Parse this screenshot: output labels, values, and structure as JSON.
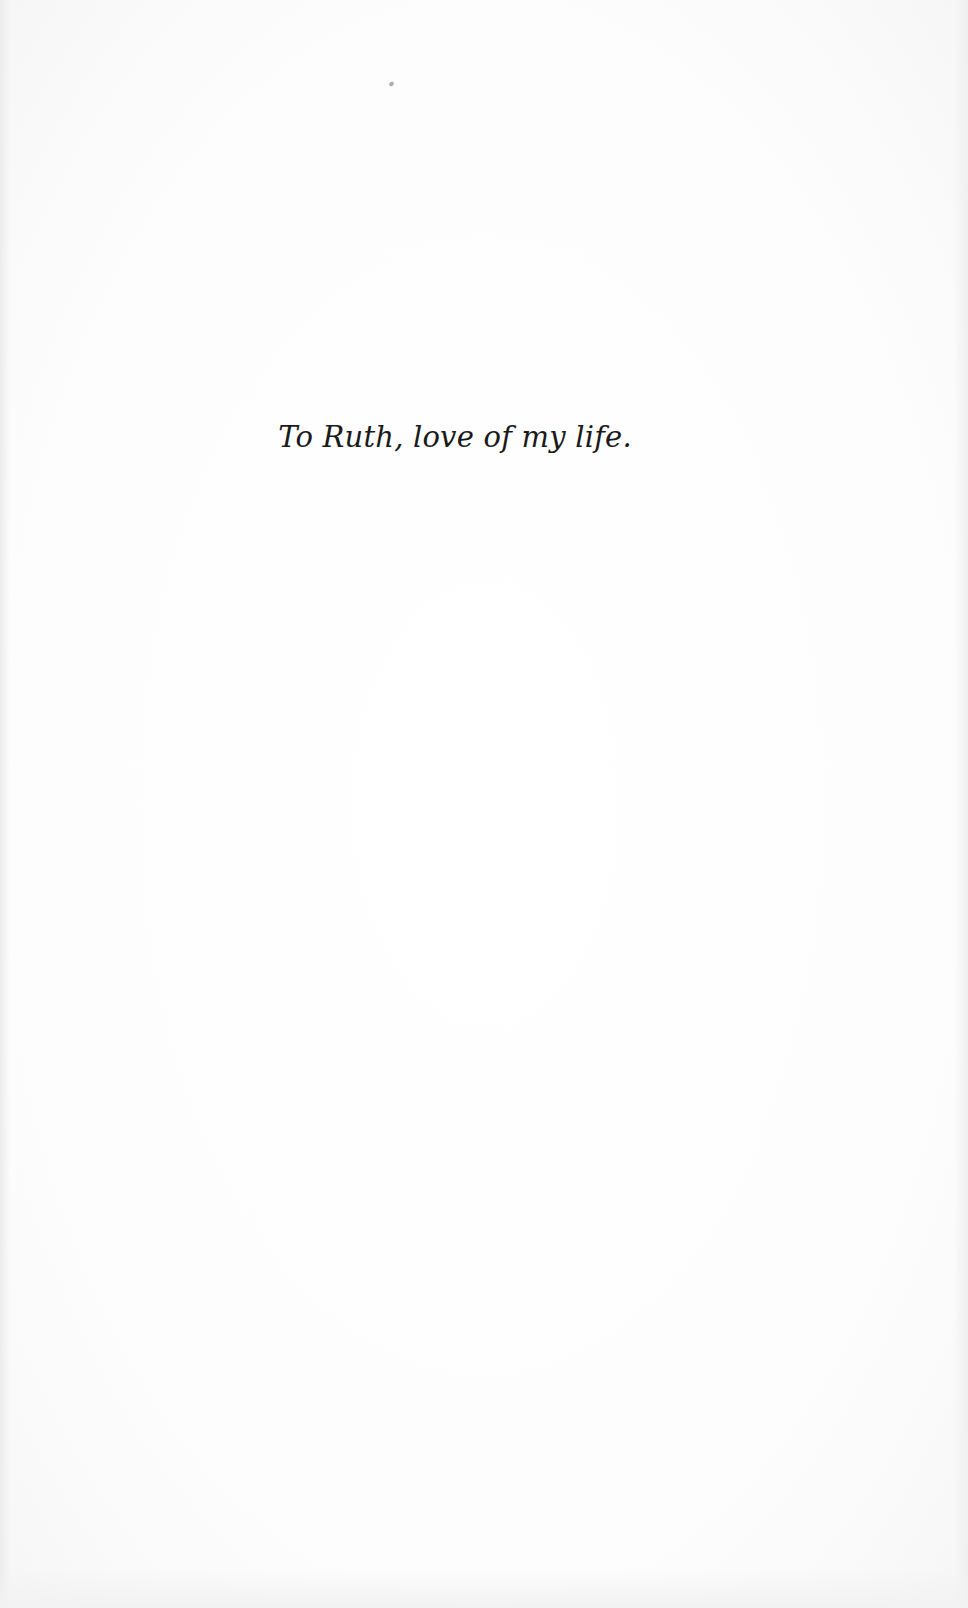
{
  "page": {
    "type": "dedication",
    "dedication_text": "To Ruth, love of my life."
  },
  "colors": {
    "paper": "#fdfdfd",
    "text": "#1a1a1a"
  }
}
